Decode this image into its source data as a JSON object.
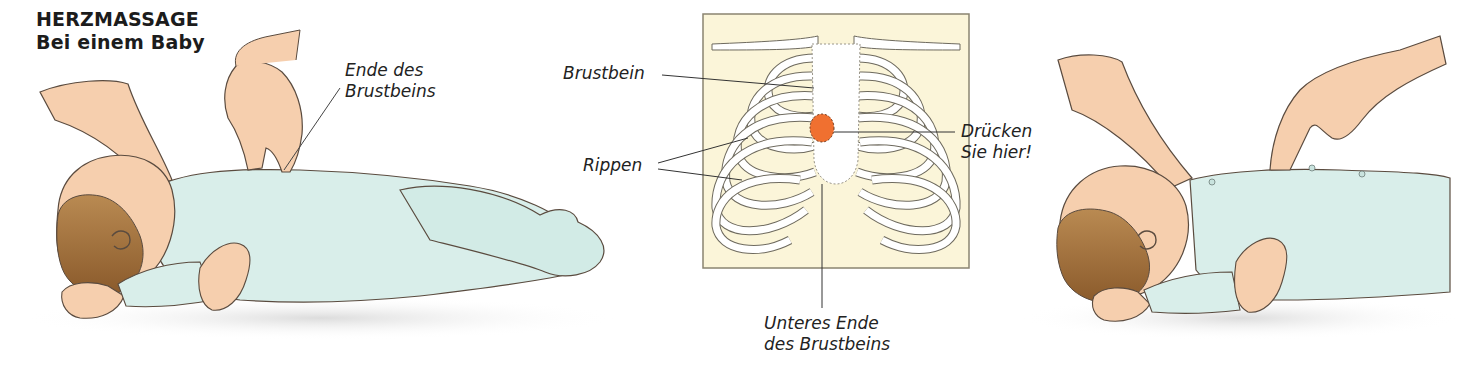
{
  "heading": {
    "title": "HERZMASSAGE",
    "subtitle": "Bei einem Baby"
  },
  "left_illustration": {
    "callout": {
      "line1": "Ende des",
      "line2": "Brustbeins"
    }
  },
  "diagram": {
    "labels": {
      "sternum": "Brustbein",
      "ribs": "Rippen",
      "press_here": {
        "line1": "Drücken",
        "line2": "Sie hier!"
      },
      "lower_end": {
        "line1": "Unteres Ende",
        "line2": "des Brustbeins"
      }
    },
    "colors": {
      "panel_fill": "#fbf5d9",
      "panel_border": "#8a8470",
      "bone_fill": "#ffffff",
      "bone_outline": "#6e6a5e",
      "press_point": "#f07030"
    }
  },
  "colors": {
    "skin": "#f6cfae",
    "skin_shadow": "#eaa783",
    "hair": "#9a6a35",
    "onesie": "#d9eeea",
    "onesie_shadow": "#bcdcd6",
    "outline": "#5a4b3f",
    "floor_shadow": "#e6e6e6"
  }
}
